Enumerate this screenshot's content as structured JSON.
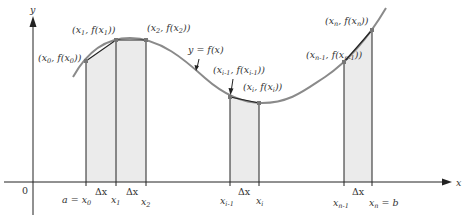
{
  "figure": {
    "colors": {
      "strip_fill": "#ebebeb",
      "curve": "#8a8a8a",
      "axes": "#222222",
      "text": "#333333"
    },
    "axes": {
      "x_label": "x",
      "y_label": "y",
      "origin_label": "0"
    },
    "curve_label": "y = f(x)",
    "points": [
      {
        "id": "x0",
        "label": "(x0, f(x0))",
        "x_tick": "a = x0"
      },
      {
        "id": "x1",
        "label": "(x1, f(x1))",
        "x_tick": "x1"
      },
      {
        "id": "x2",
        "label": "(x2, f(x2))",
        "x_tick": "x2"
      },
      {
        "id": "xim1",
        "label": "(xi-1, f(xi-1))",
        "x_tick": "xi-1"
      },
      {
        "id": "xi",
        "label": "(xi, f(xi))",
        "x_tick": "xi"
      },
      {
        "id": "xnm1",
        "label": "(xn-1, f(xn-1))",
        "x_tick": "xn-1"
      },
      {
        "id": "xn",
        "label": "(xn, f(xn))",
        "x_tick": "xn = b"
      }
    ],
    "delta_label": "Δx",
    "delta_count": 4
  }
}
